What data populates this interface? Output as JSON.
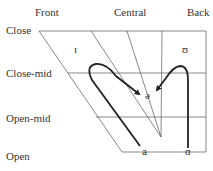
{
  "diagram": {
    "type": "vowel-chart",
    "columns": [
      {
        "label": "Front"
      },
      {
        "label": "Central"
      },
      {
        "label": "Back"
      }
    ],
    "rows": [
      {
        "label": "Close"
      },
      {
        "label": "Close-mid"
      },
      {
        "label": "Open-mid"
      },
      {
        "label": "Open"
      }
    ],
    "vowels": [
      {
        "symbol": "ɪ",
        "position": "near-close front"
      },
      {
        "symbol": "ʊ",
        "position": "near-close back"
      },
      {
        "symbol": "ə",
        "position": "mid central"
      },
      {
        "symbol": "a",
        "position": "open front-central"
      },
      {
        "symbol": "ɑ",
        "position": "open back"
      }
    ],
    "glides": [
      {
        "from": "a",
        "to": "ə",
        "via": "ɪ"
      },
      {
        "from": "ɑ",
        "to": "ə",
        "via": "ʊ"
      }
    ]
  }
}
